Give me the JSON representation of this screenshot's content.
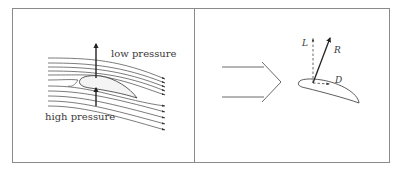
{
  "left_panel": {
    "label_top": "low pressure",
    "label_bottom": "high pressure"
  },
  "right_panel": {
    "lift_label": "L",
    "resultant_label": "R",
    "drag_label": "D"
  },
  "colors": {
    "frame": "#8a8a8a",
    "stroke": "#333333",
    "text": "#3a3a3a"
  }
}
